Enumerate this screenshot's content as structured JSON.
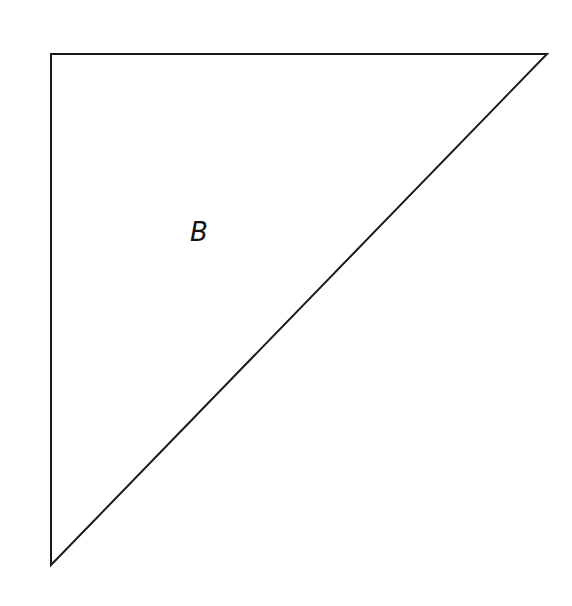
{
  "diagram": {
    "shape": "right-triangle",
    "label": "B",
    "vertices": {
      "top_left": [
        51,
        54
      ],
      "top_right": [
        547,
        54
      ],
      "bottom_left": [
        51,
        565
      ]
    },
    "stroke_color": "#1a1a1a",
    "background_color": "#ffffff"
  }
}
